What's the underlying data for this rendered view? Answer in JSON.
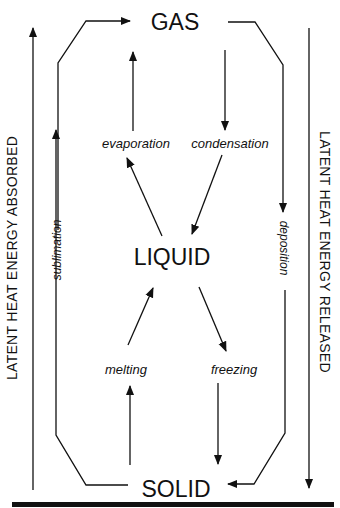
{
  "states": {
    "gas": "GAS",
    "liquid": "LIQUID",
    "solid": "SOLID"
  },
  "processes": {
    "evaporation": "evaporation",
    "condensation": "condensation",
    "melting": "melting",
    "freezing": "freezing",
    "sublimation": "sublimation",
    "deposition": "deposition"
  },
  "axes": {
    "left": "LATENT HEAT ENERGY ABSORBED",
    "right": "LATENT HEAT ENERGY RELEASED"
  },
  "colors": {
    "line": "#111111",
    "background": "#ffffff"
  }
}
